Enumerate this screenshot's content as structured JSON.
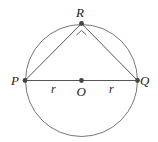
{
  "diagram": {
    "type": "geometry",
    "labels": {
      "R": "R",
      "P": "P",
      "Q": "Q",
      "O": "O",
      "r_left": "r",
      "r_right": "r"
    },
    "colors": {
      "line": "#555555",
      "point": "#444444"
    }
  }
}
